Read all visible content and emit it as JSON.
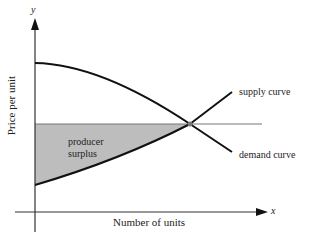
{
  "diagram": {
    "type": "economics-surplus",
    "y_axis": {
      "variable": "y",
      "label": "Price per unit"
    },
    "x_axis": {
      "variable": "x",
      "label": "Number of units"
    },
    "curves": [
      {
        "name": "supply curve"
      },
      {
        "name": "demand curve"
      }
    ],
    "region": {
      "label_line1": "producer",
      "label_line2": "surplus",
      "fill": "#bdbdbd"
    },
    "colors": {
      "stroke": "#111111",
      "equilibrium_line": "#777777"
    }
  }
}
